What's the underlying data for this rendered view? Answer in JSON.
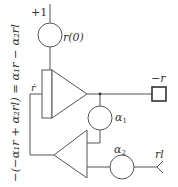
{
  "diagram": {
    "type": "analog computer block diagram",
    "side_equation": "−(−α₁r + α₂rl) = α₁r − α₂rl",
    "initial_condition": {
      "input_label": "+1",
      "potentiometer_label": "r(0)"
    },
    "integrator": {
      "input_label": "ṙ"
    },
    "output": {
      "label": "−r"
    },
    "feedback_pot_1": {
      "label": "α",
      "subscript": "1"
    },
    "feedback_pot_2": {
      "label": "α",
      "subscript": "2"
    },
    "external_input": {
      "label": "rl"
    },
    "colors": {
      "line": "#555555",
      "text": "#333333",
      "background": "#ffffff"
    }
  }
}
